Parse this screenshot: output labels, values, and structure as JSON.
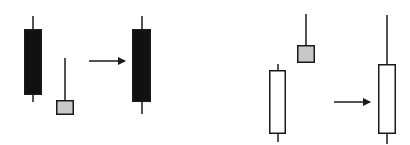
{
  "diagram": {
    "colors": {
      "background": "#ffffff",
      "outline": "#1a1a1a",
      "bearish_fill": "#111111",
      "bullish_fill": "#ffffff",
      "doji_fill": "#c8c8c8"
    },
    "panels": [
      {
        "name": "left-panel",
        "sequence": [
          {
            "type": "bearish",
            "wick_x": 33,
            "high": 16,
            "open_y": 29,
            "close_y": 95,
            "low": 102,
            "body_x": 24,
            "body_w": 18
          },
          {
            "type": "small-gray",
            "wick_x": 65,
            "high": 58,
            "open_y": 100,
            "close_y": 115,
            "low": 115,
            "body_x": 56,
            "body_w": 18
          }
        ],
        "arrow": {
          "x1": 89,
          "x2": 127,
          "y": 61
        },
        "result": {
          "type": "bearish",
          "wick_x": 142,
          "high": 16,
          "open_y": 29,
          "close_y": 102,
          "low": 114,
          "body_x": 132,
          "body_w": 19
        }
      },
      {
        "name": "right-panel",
        "sequence": [
          {
            "type": "bullish",
            "wick_x": 278,
            "high": 64,
            "open_y": 70,
            "close_y": 134,
            "low": 142,
            "body_x": 269,
            "body_w": 17
          },
          {
            "type": "small-gray",
            "wick_x": 306,
            "high": 14,
            "open_y": 45,
            "close_y": 63,
            "low": 63,
            "body_x": 297,
            "body_w": 18
          }
        ],
        "arrow": {
          "x1": 334,
          "x2": 372,
          "y": 102
        },
        "result": {
          "type": "bullish",
          "wick_x": 387,
          "high": 15,
          "open_y": 64,
          "close_y": 134,
          "low": 144,
          "body_x": 378,
          "body_w": 18
        }
      }
    ]
  }
}
